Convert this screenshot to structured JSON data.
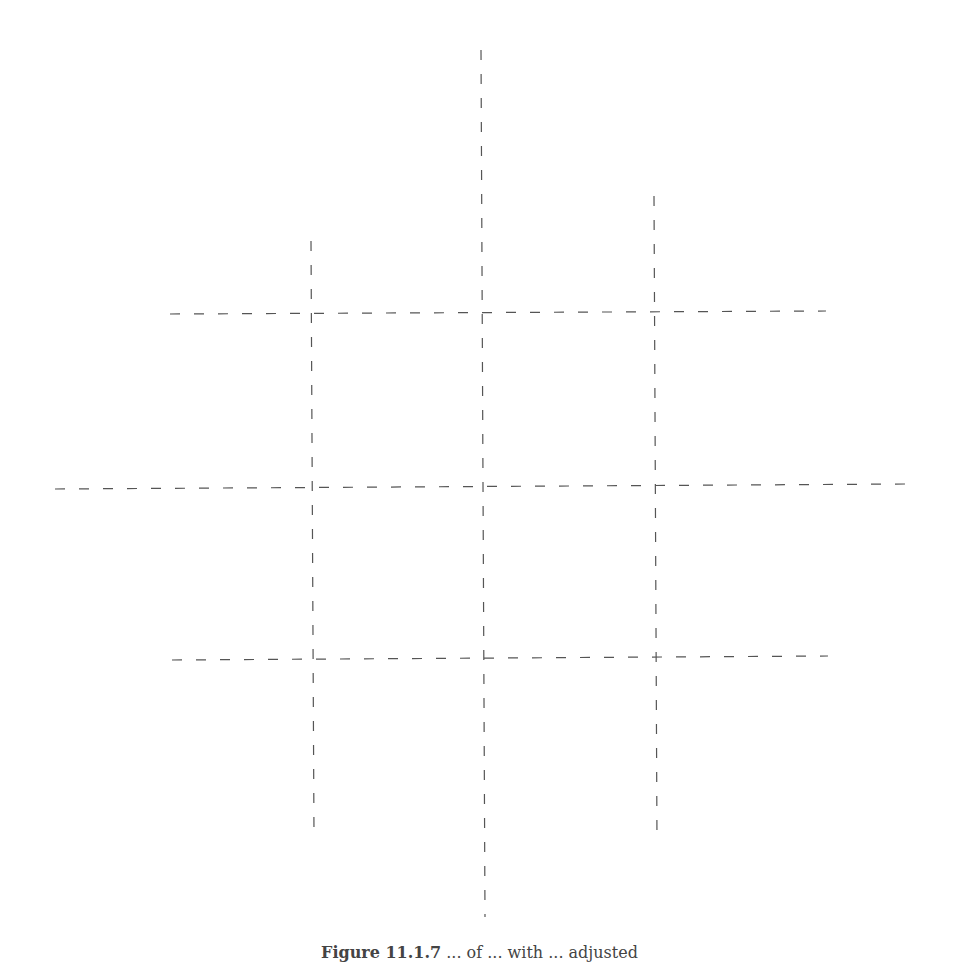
{
  "figure": {
    "width": 959,
    "height": 956,
    "stroke_color": "#555555",
    "stroke_width": 1.2,
    "dash_pattern": "10 14",
    "horizontal_lines": [
      {
        "id": "top",
        "x1": 170,
        "y1": 314,
        "x2": 826,
        "y2": 311
      },
      {
        "id": "middle",
        "x1": 55,
        "y1": 489,
        "x2": 908,
        "y2": 484
      },
      {
        "id": "bottom",
        "x1": 172,
        "y1": 660,
        "x2": 828,
        "y2": 656
      }
    ],
    "vertical_lines": [
      {
        "id": "left",
        "x1": 311,
        "y1": 241,
        "x2": 314,
        "y2": 836
      },
      {
        "id": "center",
        "x1": 481,
        "y1": 50,
        "x2": 485,
        "y2": 917
      },
      {
        "id": "right",
        "x1": 654,
        "y1": 196,
        "x2": 657,
        "y2": 843
      }
    ]
  },
  "caption": {
    "label": "Figure 11.1.7",
    "text": "... of ... with ... adjusted"
  }
}
